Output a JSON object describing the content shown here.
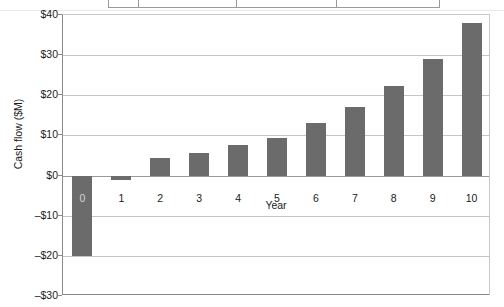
{
  "top_table": {
    "cells": [
      "",
      "",
      "",
      ""
    ]
  },
  "chart_data": {
    "type": "bar",
    "title": "",
    "xlabel": "Year",
    "ylabel": "Cash flow ($M)",
    "categories": [
      "0",
      "1",
      "2",
      "3",
      "4",
      "5",
      "6",
      "7",
      "8",
      "9",
      "10"
    ],
    "values": [
      -20,
      -1,
      4.3,
      5.7,
      7.6,
      9.3,
      13,
      17,
      22.2,
      29,
      38
    ],
    "ylim": [
      -30,
      40
    ],
    "ytick_values": [
      40,
      30,
      20,
      10,
      0,
      -10,
      -20,
      -30
    ],
    "ytick_labels": [
      "$40",
      "$30",
      "$20",
      "$10",
      "$0",
      "–$10",
      "–$20",
      "–$30"
    ],
    "grid": true,
    "legend": "none",
    "bar_color": "#6b6b6b",
    "grid_color": "#c4c4c4",
    "axis_color": "#8a8a8a"
  }
}
